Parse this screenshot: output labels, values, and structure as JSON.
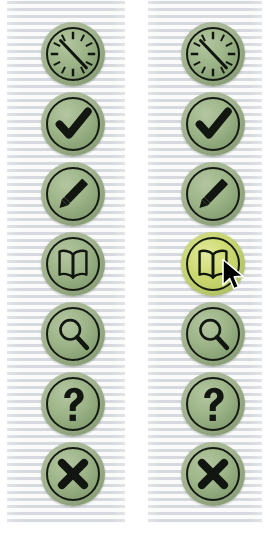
{
  "screen": {
    "width": 275,
    "height": 533,
    "background_color": "#ffffff",
    "description": "Side-by-side comparison of a vertical circular icon toolbar, normal state on the left and hover-highlighted state on the right"
  },
  "background": {
    "pattern": "horizontal-stripes",
    "stripe_color": "#d6d9dd",
    "gap_color": "#fbfbfc",
    "stripe_period_px": 7
  },
  "theme": {
    "button_fill": "#8fa87c",
    "button_fill_light": "#b4c6a1",
    "button_outline": "#141a12",
    "button_halo": "#a3b491",
    "highlight_fill": "#c8d668",
    "highlight_fill_light": "#e2ea9c",
    "glyph_color": "#111611",
    "cursor_color": "#000000",
    "cursor_outline": "#ffffff"
  },
  "panels": [
    {
      "name": "normal-state-panel",
      "label": "Normal",
      "x": 7,
      "width": 118
    },
    {
      "name": "highlighted-state-panel",
      "label": "Highlighted",
      "x": 148,
      "width": 114
    }
  ],
  "toolbar": {
    "orientation": "vertical",
    "button_diameter_px": 64,
    "button_spacing_px": 70,
    "first_button_top_px": 22,
    "buttons": [
      {
        "id": "compass",
        "icon": "compass-clock-icon",
        "label": "Compass",
        "tooltip": "Navigate",
        "state": "normal"
      },
      {
        "id": "check",
        "icon": "checkmark-icon",
        "label": "Accept",
        "tooltip": "Accept",
        "state": "normal"
      },
      {
        "id": "pencil",
        "icon": "pencil-icon",
        "label": "Edit",
        "tooltip": "Edit",
        "state": "normal"
      },
      {
        "id": "book",
        "icon": "open-book-icon",
        "label": "Read",
        "tooltip": "Read",
        "state": "normal"
      },
      {
        "id": "search",
        "icon": "magnifier-icon",
        "label": "Search",
        "tooltip": "Search",
        "state": "normal"
      },
      {
        "id": "help",
        "icon": "question-mark-icon",
        "label": "Help",
        "tooltip": "Help",
        "state": "normal"
      },
      {
        "id": "close",
        "icon": "cross-icon",
        "label": "Close",
        "tooltip": "Close",
        "state": "normal"
      }
    ],
    "highlighted_button_id": "book"
  },
  "cursor": {
    "name": "mouse-pointer",
    "icon": "cursor-arrow-icon",
    "x": 221,
    "y": 258,
    "over_button_id": "book"
  }
}
